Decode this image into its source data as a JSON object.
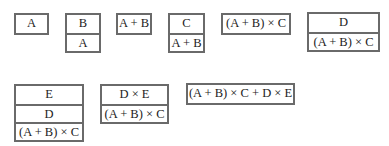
{
  "diagram": {
    "stacks": [
      {
        "id": "s1",
        "cells": [
          "A"
        ]
      },
      {
        "id": "s2",
        "cells": [
          "B",
          "A"
        ]
      },
      {
        "id": "s3",
        "cells": [
          "A + B"
        ]
      },
      {
        "id": "s4",
        "cells": [
          "C",
          "A + B"
        ]
      },
      {
        "id": "s5",
        "cells": [
          "(A + B) × C"
        ]
      },
      {
        "id": "s6",
        "cells": [
          "D",
          "(A + B) × C"
        ]
      },
      {
        "id": "s7",
        "cells": [
          "E",
          "D",
          "(A + B) × C"
        ]
      },
      {
        "id": "s8",
        "cells": [
          "D × E",
          "(A + B) × C"
        ]
      },
      {
        "id": "s9",
        "cells": [
          "(A + B) × C + D × E"
        ]
      }
    ]
  }
}
